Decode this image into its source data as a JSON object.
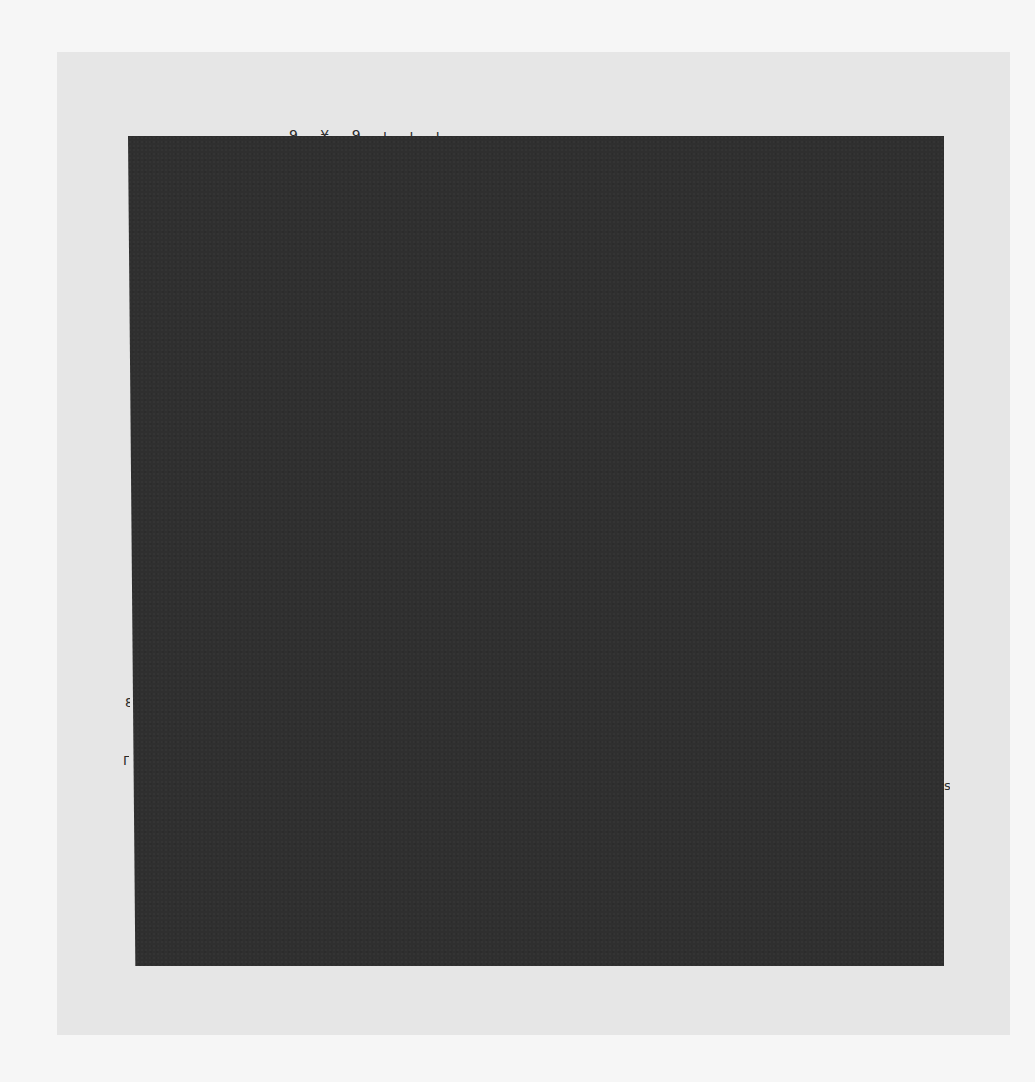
{
  "document": {
    "type": "scanned page",
    "content_state": "obscured by dark block",
    "fragments": {
      "top_edge": "9 ¥ 9 ı ı ı",
      "left_edge_1": "8",
      "left_edge_2": "Γ",
      "right_edge": "s"
    }
  },
  "colors": {
    "outer_background": "#f6f6f6",
    "page": "#e6e6e6",
    "block": "#2f2f2f"
  }
}
